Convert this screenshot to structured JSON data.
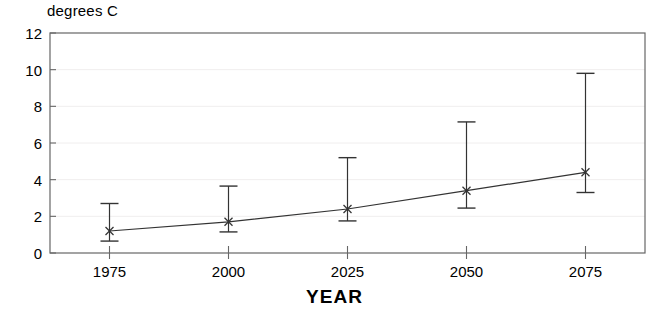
{
  "chart_data": {
    "type": "line",
    "title": "",
    "ylabel": "degrees C",
    "xlabel": "YEAR",
    "categories": [
      1975,
      2000,
      2025,
      2050,
      2075
    ],
    "x_tick_labels": [
      "1975",
      "2000",
      "2025",
      "2050",
      "2075"
    ],
    "y_tick_labels": [
      "0",
      "2",
      "4",
      "6",
      "8",
      "10",
      "12"
    ],
    "y_ticks": [
      0,
      2,
      4,
      6,
      8,
      10,
      12
    ],
    "ylim": [
      0,
      12
    ],
    "xlim": [
      1962.5,
      2087.5
    ],
    "grid": true,
    "legend": null,
    "series": [
      {
        "name": "best estimate",
        "values": [
          1.2,
          1.7,
          2.4,
          3.4,
          4.4
        ],
        "err_low": [
          0.65,
          1.15,
          1.75,
          2.45,
          3.3
        ],
        "err_high": [
          2.7,
          3.65,
          5.2,
          7.15,
          9.8
        ],
        "marker": "x",
        "color": "#000000"
      }
    ]
  },
  "axes": {
    "y_axis_caption": "degrees C",
    "x_axis_caption": "YEAR"
  },
  "style": {
    "line_color": "#333333",
    "frame_color": "#666666",
    "grid_color": "#f0eeee",
    "text_color": "#000000"
  }
}
